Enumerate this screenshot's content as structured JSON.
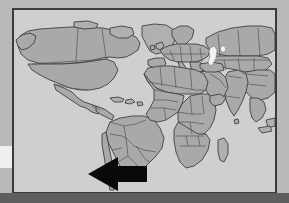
{
  "image": {
    "kind": "world-political-map-with-arrow-annotation",
    "title": "World map with black arrow pointing at South America",
    "width": 289,
    "height": 203
  },
  "colors": {
    "outer_mat": "#b9b9b9",
    "bottom_band": "#5e5e5e",
    "page_background": "#6e6e6e",
    "left_sliver": "#efefef",
    "frame_border": "#3a3a3a",
    "ocean": "#cfcfcf",
    "land": "#a9a9a9",
    "land_alt": "#b0b0b0",
    "country_border": "#555555",
    "coastline": "#3f3f3f",
    "inland_water": "#f2f2f2",
    "arrow": "#090909"
  },
  "frame": {
    "x": 12,
    "y": 8,
    "width": 265,
    "height": 186,
    "border_width": 2
  },
  "arrow": {
    "label": "black-left-arrow",
    "direction": "left",
    "points_to": "southern South America",
    "tip_x": 86,
    "tip_y": 172,
    "tail_x": 145,
    "top_y": 155,
    "bottom_y": 190,
    "fill": "#090909"
  },
  "map": {
    "projection": "equirectangular",
    "style": "grayscale political",
    "continents": [
      {
        "name": "North America",
        "visible": true
      },
      {
        "name": "South America",
        "visible": true
      },
      {
        "name": "Europe",
        "visible": true
      },
      {
        "name": "Africa",
        "visible": true
      },
      {
        "name": "Asia",
        "visible": true
      }
    ],
    "inland_water_features": [
      {
        "name": "Caspian Sea",
        "x": 208,
        "y": 48,
        "width": 7,
        "height": 16
      },
      {
        "name": "Aral Sea",
        "x": 219,
        "y": 47,
        "width": 4,
        "height": 5
      }
    ],
    "islands": [
      {
        "name": "Greenland",
        "visible": true
      },
      {
        "name": "Madagascar",
        "visible": true
      },
      {
        "name": "Caribbean Islands",
        "visible": true
      },
      {
        "name": "British Isles",
        "visible": true
      },
      {
        "name": "Sri Lanka",
        "visible": true
      }
    ]
  }
}
